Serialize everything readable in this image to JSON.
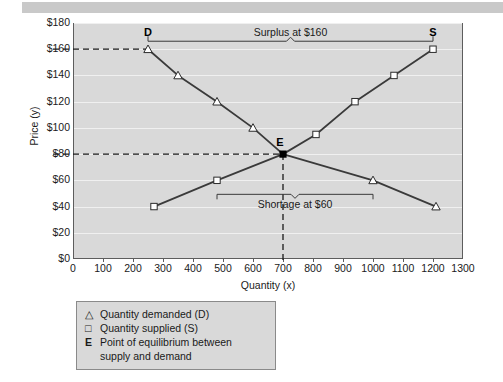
{
  "topbar": {
    "ghost_left": "",
    "ghost_right": ""
  },
  "chart_data": {
    "type": "line",
    "title": "",
    "xlabel": "Quantity (x)",
    "ylabel": "Price (y)",
    "xlim": [
      0,
      1300
    ],
    "ylim": [
      0,
      180
    ],
    "xticks": [
      0,
      100,
      200,
      300,
      400,
      500,
      600,
      700,
      800,
      900,
      1000,
      1100,
      1200,
      1300
    ],
    "yticks": [
      0,
      20,
      40,
      60,
      80,
      100,
      120,
      140,
      160,
      180
    ],
    "ytick_labels": [
      "$0",
      "$20",
      "$40",
      "$60",
      "$80",
      "$100",
      "$120",
      "$140",
      "$160",
      "$180"
    ],
    "xtick_labels": [
      "0",
      "100",
      "200",
      "300",
      "400",
      "500",
      "600",
      "700",
      "800",
      "900",
      "1000",
      "1100",
      "1200",
      "1300"
    ],
    "grid": true,
    "legend_position": "below-plot",
    "series": [
      {
        "name": "Quantity demanded (D)",
        "marker": "triangle",
        "points": [
          {
            "x": 250,
            "y": 160
          },
          {
            "x": 350,
            "y": 140
          },
          {
            "x": 480,
            "y": 120
          },
          {
            "x": 600,
            "y": 100
          },
          {
            "x": 700,
            "y": 80
          },
          {
            "x": 1000,
            "y": 60
          },
          {
            "x": 1210,
            "y": 40
          }
        ]
      },
      {
        "name": "Quantity supplied (S)",
        "marker": "square",
        "points": [
          {
            "x": 270,
            "y": 40
          },
          {
            "x": 480,
            "y": 60
          },
          {
            "x": 700,
            "y": 80
          },
          {
            "x": 810,
            "y": 95
          },
          {
            "x": 940,
            "y": 120
          },
          {
            "x": 1070,
            "y": 140
          },
          {
            "x": 1200,
            "y": 160
          }
        ]
      }
    ],
    "equilibrium": {
      "x": 700,
      "y": 80,
      "label": "E"
    },
    "annotations": [
      {
        "name": "surplus",
        "text": "Surplus at $160",
        "price": 160,
        "from_x": 250,
        "to_x": 1200
      },
      {
        "name": "shortage",
        "text": "Shortage at $60",
        "price": 60,
        "from_x": 480,
        "to_x": 1000
      },
      {
        "name": "demand-endpoint",
        "text": "D",
        "x": 250,
        "y": 160
      },
      {
        "name": "supply-endpoint",
        "text": "S",
        "x": 1200,
        "y": 160
      }
    ]
  },
  "legend": {
    "items": [
      {
        "marker": "△",
        "label": "Quantity demanded (D)"
      },
      {
        "marker": "□",
        "label": "Quantity supplied (S)"
      },
      {
        "marker": "E",
        "label": "Point of equilibrium between",
        "label2": "supply and demand"
      }
    ]
  },
  "colors": {
    "plot_bg": "#d9d9d9",
    "frame": "#5d5d5d",
    "grid": "#f0f0f0",
    "line": "#3a3a3a",
    "text": "#1a1a1a"
  }
}
